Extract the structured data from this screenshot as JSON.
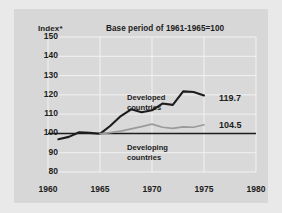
{
  "chart_data": {
    "type": "line",
    "title": "Base period of 1961-1965=100",
    "ylabel": "Index*",
    "xlabel": "",
    "xlim": [
      1960,
      1980
    ],
    "ylim": [
      80,
      150
    ],
    "xticks": [
      1960,
      1965,
      1970,
      1975,
      1980
    ],
    "yticks": [
      80,
      90,
      100,
      110,
      120,
      130,
      140,
      150
    ],
    "grid": true,
    "legend_position": "inline-annotations",
    "reference_line": {
      "value": 100,
      "label": "100",
      "color": "#1c1c1c"
    },
    "series": [
      {
        "name": "Developed countries",
        "color": "#1c1c1c",
        "end_label": "119.7",
        "x": [
          1961,
          1962,
          1963,
          1964,
          1965,
          1966,
          1967,
          1968,
          1969,
          1970,
          1971,
          1972,
          1973,
          1974,
          1975
        ],
        "values": [
          97.0,
          98.2,
          100.6,
          100.3,
          99.8,
          104.0,
          109.0,
          112.5,
          111.0,
          112.0,
          115.5,
          114.8,
          121.8,
          121.5,
          119.7
        ]
      },
      {
        "name": "Developing countries",
        "color": "#9a9a9a",
        "end_label": "104.5",
        "x": [
          1965,
          1966,
          1967,
          1968,
          1969,
          1970,
          1971,
          1972,
          1973,
          1974,
          1975
        ],
        "values": [
          99.8,
          100.4,
          101.2,
          102.4,
          103.5,
          104.8,
          103.2,
          102.6,
          103.4,
          103.2,
          104.5
        ]
      }
    ]
  },
  "annotations": {
    "developed": {
      "line1": "Developed",
      "line2": "countries"
    },
    "developing": {
      "line1": "Developing",
      "line2": "countries"
    }
  },
  "colors": {
    "figure_background": "#e9e9e9",
    "panel_background": "#d7d7d7",
    "gridline": "#f2f2f2",
    "developed_line": "#1c1c1c",
    "developing_line": "#9a9a9a",
    "text": "#1c1c1c"
  }
}
